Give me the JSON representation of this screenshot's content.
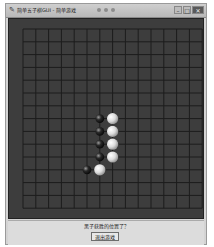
{
  "window": {
    "title": "简单五子棋GUI - 简单游戏",
    "controls": [
      {
        "name": "minimize",
        "glyph": "–"
      },
      {
        "name": "maximize",
        "glyph": "□"
      },
      {
        "name": "close",
        "glyph": "✕"
      }
    ]
  },
  "board": {
    "size": 15,
    "cell_px": 12.8,
    "origin_px": [
      14,
      10
    ],
    "background": "#3d3d3d",
    "line_color": "#1c1c1c",
    "stones": [
      {
        "color": "black",
        "col": 6,
        "row": 7
      },
      {
        "color": "black",
        "col": 6,
        "row": 8
      },
      {
        "color": "black",
        "col": 6,
        "row": 9
      },
      {
        "color": "black",
        "col": 6,
        "row": 10
      },
      {
        "color": "black",
        "col": 5,
        "row": 11
      },
      {
        "color": "white",
        "col": 7,
        "row": 7
      },
      {
        "color": "white",
        "col": 7,
        "row": 8
      },
      {
        "color": "white",
        "col": 7,
        "row": 9
      },
      {
        "color": "white",
        "col": 7,
        "row": 10
      },
      {
        "color": "white",
        "col": 6,
        "row": 11
      }
    ]
  },
  "status": {
    "message": "黑子获胜的位置了？",
    "button_label": "退出游戏"
  },
  "colors": {
    "black_stone": "#1a1a1a",
    "white_stone": "#e6e6e6"
  }
}
